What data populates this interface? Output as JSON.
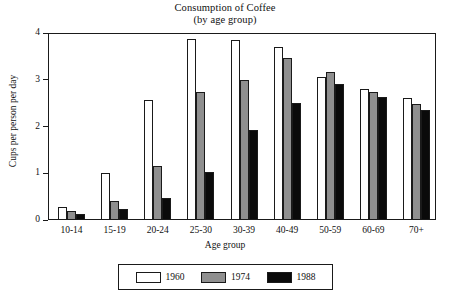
{
  "chart_data": {
    "type": "bar",
    "title": "Consumption of Coffee",
    "subtitle": "(by age group)",
    "xlabel": "Age group",
    "ylabel": "Cups per person per day",
    "ylim": [
      0,
      4
    ],
    "yticks": [
      0,
      1,
      2,
      3,
      4
    ],
    "grid": false,
    "legend_position": "bottom-center",
    "categories": [
      "10-14",
      "15-19",
      "20-24",
      "25-30",
      "30-39",
      "40-49",
      "50-59",
      "60-69",
      "70+"
    ],
    "series": [
      {
        "name": "1960",
        "color": "#ffffff",
        "values": [
          0.27,
          1.0,
          2.57,
          3.87,
          3.85,
          3.7,
          3.06,
          2.8,
          2.61
        ]
      },
      {
        "name": "1974",
        "color": "#8f8f8f",
        "values": [
          0.2,
          0.4,
          1.15,
          2.74,
          2.99,
          3.46,
          3.17,
          2.74,
          2.48
        ]
      },
      {
        "name": "1988",
        "color": "#0a0a0a",
        "values": [
          0.13,
          0.23,
          0.47,
          1.03,
          1.93,
          2.5,
          2.91,
          2.63,
          2.35
        ]
      }
    ]
  }
}
